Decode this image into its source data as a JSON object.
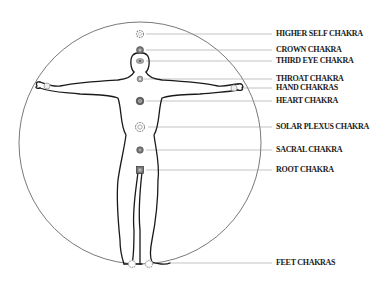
{
  "diagram": {
    "title": "",
    "colors": {
      "lines": "#1a1a1a",
      "leaders": "#9a9a9a",
      "chakra_fill": "#8a8a8a"
    },
    "labels": [
      {
        "text": "HIGHER SELF CHAKRA",
        "y": 34,
        "point": [
          140,
          34
        ]
      },
      {
        "text": "CROWN CHAKRA",
        "y": 50,
        "point": [
          140,
          50
        ]
      },
      {
        "text": "THIRD EYE CHAKRA",
        "y": 61,
        "point": [
          140,
          61
        ]
      },
      {
        "text": "THROAT CHAKRA",
        "y": 79,
        "point": [
          140,
          79
        ]
      },
      {
        "text": "HAND CHAKRAS",
        "y": 88,
        "point": [
          236,
          88
        ]
      },
      {
        "text": "HEART CHAKRA",
        "y": 101,
        "point": [
          140,
          101
        ]
      },
      {
        "text": "SOLAR PLEXUS CHAKRA",
        "y": 127,
        "point": [
          140,
          127
        ]
      },
      {
        "text": "SACRAL CHAKRA",
        "y": 150,
        "point": [
          140,
          150
        ]
      },
      {
        "text": "ROOT CHAKRA",
        "y": 170,
        "point": [
          140,
          170
        ]
      },
      {
        "text": "FEET CHAKRAS",
        "y": 263,
        "point": [
          160,
          263
        ]
      }
    ]
  }
}
